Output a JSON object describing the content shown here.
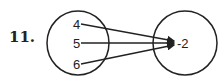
{
  "problem_number": "11.",
  "domain_set": [
    "4",
    "5",
    "6"
  ],
  "range_set": [
    "-2"
  ],
  "mappings": [
    {
      "from": "4",
      "to": "-2"
    },
    {
      "from": "5",
      "to": "-2"
    },
    {
      "from": "6",
      "to": "-2"
    }
  ],
  "colors": {
    "stroke": "#222222",
    "background": "#ffffff"
  }
}
